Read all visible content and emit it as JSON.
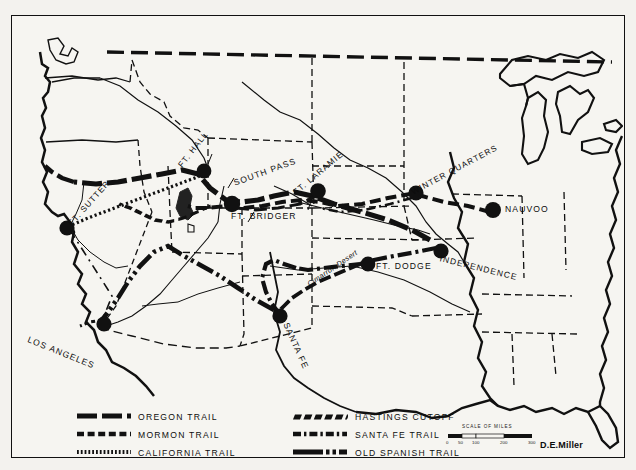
{
  "map": {
    "title": "Western Trails Map",
    "author": "D.E.Miller",
    "background_color": "#f6f5f1",
    "ink_color": "#111111",
    "places": [
      {
        "name": "FT. HALL",
        "label": "FT. HALL",
        "x": 192,
        "y": 155,
        "lx": 178,
        "ly": 150,
        "rot": -52
      },
      {
        "name": "SOUTH PASS",
        "label": "SOUTH PASS",
        "x": 0,
        "y": 0,
        "lx": 228,
        "ly": 158,
        "rot": -20
      },
      {
        "name": "FT. LARAMIE",
        "label": "FT. LARAMIE",
        "x": 306,
        "y": 175,
        "lx": 288,
        "ly": 170,
        "rot": -38
      },
      {
        "name": "FT. BRIDGER",
        "label": "FT. BRIDGER",
        "x": 220,
        "y": 188,
        "lx": 226,
        "ly": 190,
        "rot": 0
      },
      {
        "name": "FT. SUTTER",
        "label": "FT. SUTTER",
        "x": 55,
        "y": 212,
        "lx": 57,
        "ly": 208,
        "rot": -46
      },
      {
        "name": "WINTER QUARTERS",
        "label": "WINTER QUARTERS",
        "x": 404,
        "y": 177,
        "lx": 404,
        "ly": 173,
        "rot": -27
      },
      {
        "name": "NAUVOO",
        "label": "NAUVOO",
        "x": 481,
        "y": 194,
        "lx": 495,
        "ly": 192,
        "rot": 0
      },
      {
        "name": "INDEPENDENCE",
        "label": "INDEPENDENCE",
        "x": 429,
        "y": 235,
        "lx": 432,
        "ly": 238,
        "rot": 14
      },
      {
        "name": "FT. DODGE",
        "label": "FT. DODGE",
        "x": 356,
        "y": 248,
        "lx": 364,
        "ly": 252,
        "rot": 0
      },
      {
        "name": "SANTA FE",
        "label": "SANTA FE",
        "x": 268,
        "y": 300,
        "lx": 274,
        "ly": 305,
        "rot": 66
      },
      {
        "name": "LOS ANGELES",
        "label": "LOS ANGELES",
        "x": 92,
        "y": 308,
        "lx": 22,
        "ly": 320,
        "rot": 22
      },
      {
        "name": "CIMARRON DESERT",
        "label": "Cimarron Desert",
        "x": 0,
        "y": 0,
        "lx": 300,
        "ly": 267,
        "rot": -34
      }
    ],
    "scale": {
      "title": "SCALE OF MILES",
      "ticks": [
        "0",
        "50",
        "100",
        "200",
        "300"
      ]
    }
  },
  "legend": {
    "left_column": [
      {
        "key": "oregon-trail",
        "label": "OREGON  TRAIL",
        "style": "thick-dash-block"
      },
      {
        "key": "mormon-trail",
        "label": "MORMON  TRAIL",
        "style": "medium-dash"
      },
      {
        "key": "california-trail",
        "label": "CALIFORNIA  TRAIL",
        "style": "fine-dotted"
      }
    ],
    "right_column": [
      {
        "key": "hastings-cutoff",
        "label": "HASTINGS  CUTOFF",
        "style": "slant-dash"
      },
      {
        "key": "santa-fe-trail",
        "label": "SANTA  FE  TRAIL",
        "style": "dash-dot"
      },
      {
        "key": "old-spanish-trail",
        "label": "OLD  SPANISH TRAIL",
        "style": "long-dash-dot-dot"
      }
    ]
  }
}
